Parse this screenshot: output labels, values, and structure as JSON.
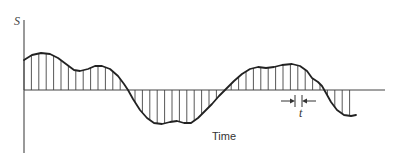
{
  "diagram": {
    "y_axis_label": "S",
    "x_axis_label": "Time",
    "interval_label": "t",
    "colors": {
      "background": "#ffffff",
      "curve": "#222222",
      "axis": "#555555",
      "samples": "#444444"
    },
    "geometry": {
      "y_axis": {
        "x": 24,
        "y_top": 20,
        "y_bottom": 153
      },
      "baseline": {
        "y": 90,
        "x_start": 24,
        "x_end": 385
      },
      "curve_points": [
        [
          24,
          60
        ],
        [
          32,
          55
        ],
        [
          41,
          53
        ],
        [
          50,
          54
        ],
        [
          58,
          58
        ],
        [
          66,
          64
        ],
        [
          74,
          70
        ],
        [
          80,
          71
        ],
        [
          88,
          69
        ],
        [
          95,
          66
        ],
        [
          102,
          66
        ],
        [
          110,
          69
        ],
        [
          118,
          76
        ],
        [
          124,
          84
        ],
        [
          128,
          90
        ],
        [
          133,
          99
        ],
        [
          140,
          110
        ],
        [
          147,
          118
        ],
        [
          154,
          123
        ],
        [
          162,
          124
        ],
        [
          170,
          122
        ],
        [
          177,
          121
        ],
        [
          184,
          123
        ],
        [
          191,
          123
        ],
        [
          198,
          118
        ],
        [
          205,
          111
        ],
        [
          212,
          104
        ],
        [
          219,
          96
        ],
        [
          226,
          89
        ],
        [
          234,
          81
        ],
        [
          242,
          74
        ],
        [
          250,
          69
        ],
        [
          258,
          67
        ],
        [
          266,
          68
        ],
        [
          274,
          67
        ],
        [
          282,
          65
        ],
        [
          292,
          64
        ],
        [
          300,
          66
        ],
        [
          307,
          71
        ],
        [
          312,
          78
        ],
        [
          318,
          82
        ],
        [
          322,
          86
        ],
        [
          326,
          93
        ],
        [
          331,
          102
        ],
        [
          337,
          110
        ],
        [
          344,
          115
        ],
        [
          351,
          116
        ],
        [
          356,
          115
        ]
      ],
      "sample_spacing": 7.4,
      "sample_start_x": 24,
      "sample_end_x": 352
    },
    "interval_annotation": {
      "left_tick_x": 295,
      "right_tick_x": 302,
      "y": 101,
      "label_x": 299,
      "label_y": 117
    },
    "labels_pos": {
      "s": {
        "x": 14,
        "y": 25
      },
      "time": {
        "x": 212,
        "y": 140
      }
    }
  }
}
